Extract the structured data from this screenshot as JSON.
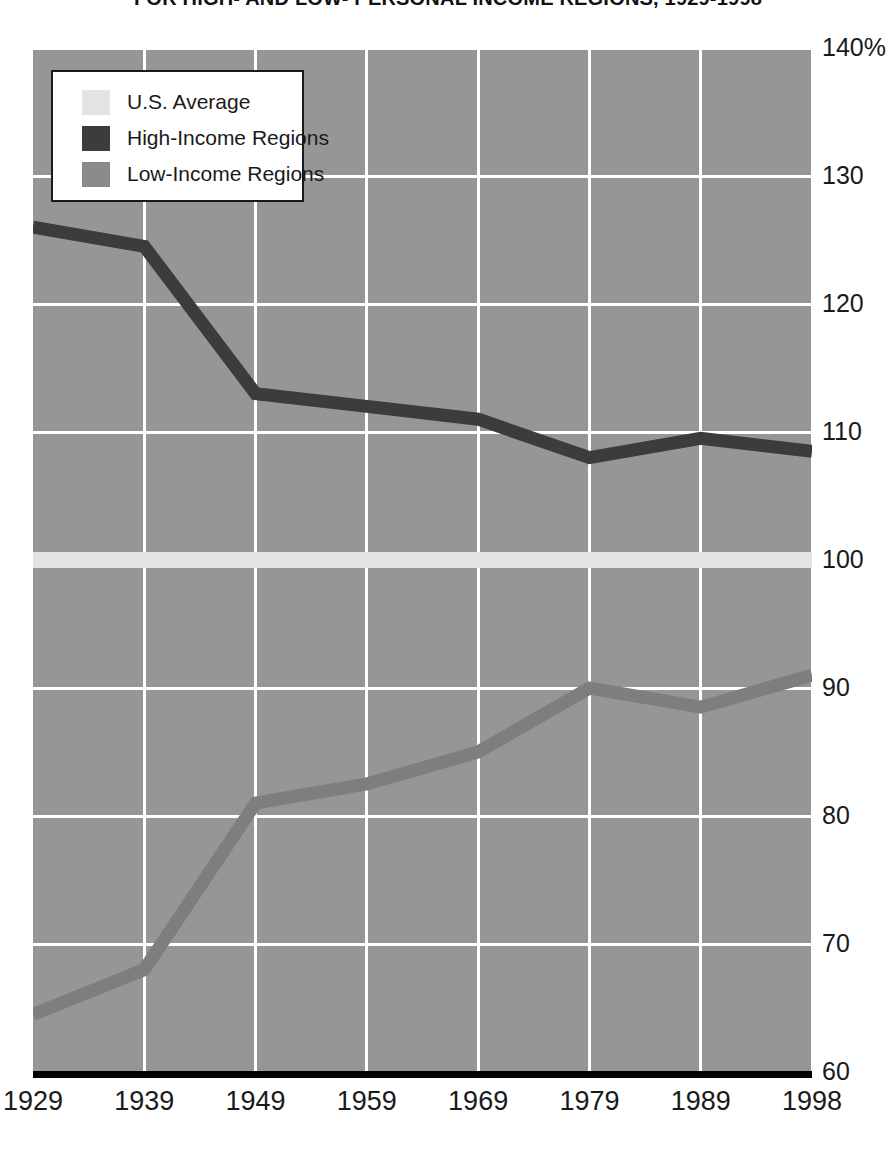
{
  "chart_data": {
    "type": "line",
    "title": "FOR HIGH- AND LOW- PERSONAL INCOME REGIONS, 1929-1998",
    "xlabel": "",
    "ylabel": "",
    "x": [
      1929,
      1939,
      1949,
      1959,
      1969,
      1979,
      1989,
      1998
    ],
    "xtick_labels": [
      "1929",
      "1939",
      "1949",
      "1959",
      "1969",
      "1979",
      "1989",
      "1998"
    ],
    "ytick_labels": [
      "140%",
      "130",
      "120",
      "110",
      "100",
      "90",
      "80",
      "70",
      "60"
    ],
    "ytick_values": [
      140,
      130,
      120,
      110,
      100,
      90,
      80,
      70,
      60
    ],
    "ylim": [
      60,
      140
    ],
    "grid": true,
    "legend_position": "top-left",
    "series": [
      {
        "name": "U.S. Average",
        "color": "#e3e3e3",
        "values": [
          100,
          100,
          100,
          100,
          100,
          100,
          100,
          100
        ]
      },
      {
        "name": "High-Income Regions",
        "color": "#3c3c3c",
        "values": [
          126,
          124.5,
          113,
          112,
          111,
          108,
          109.5,
          108.5
        ]
      },
      {
        "name": "Low-Income Regions",
        "color": "#7e7e7e",
        "values": [
          64.5,
          68,
          81,
          82.5,
          85,
          90,
          88.5,
          91
        ]
      }
    ]
  },
  "legend": {
    "items": [
      {
        "label": "U.S. Average",
        "color": "#e3e3e3"
      },
      {
        "label": "High-Income Regions",
        "color": "#3c3c3c"
      },
      {
        "label": "Low-Income Regions",
        "color": "#8a8a8a"
      }
    ]
  },
  "colors": {
    "plot_background": "#969696",
    "gridline": "#ffffff",
    "baseline": "#000000",
    "text": "#1a1a1a"
  }
}
